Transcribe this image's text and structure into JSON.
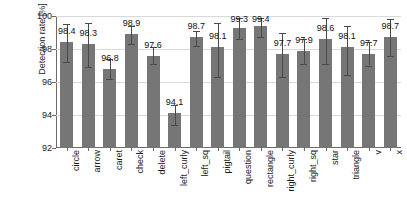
{
  "chart_data": {
    "type": "bar",
    "title": "",
    "xlabel": "",
    "ylabel": "Detection rate [%]",
    "ylim": [
      92,
      100
    ],
    "yticks": [
      92,
      94,
      96,
      98,
      100
    ],
    "grid": true,
    "legend": false,
    "bar_color": "#767676",
    "errorbar_color": "#4a4a4a",
    "categories": [
      "circle",
      "arrow",
      "caret",
      "check",
      "delete",
      "left_curly",
      "left_sq",
      "pigtail",
      "question",
      "rectangle",
      "right_curly",
      "right_sq",
      "star",
      "triangle",
      "v",
      "x"
    ],
    "values": [
      98.4,
      98.3,
      96.8,
      98.9,
      97.6,
      94.1,
      98.7,
      98.1,
      99.3,
      99.4,
      97.7,
      97.9,
      98.6,
      98.1,
      97.7,
      98.7
    ],
    "value_labels": [
      "98.4",
      "98.3",
      "96.8",
      "98.9",
      "97.6",
      "94.1",
      "98.7",
      "98.1",
      "99.3",
      "99.4",
      "97.7",
      "97.9",
      "98.6",
      "98.1",
      "97.7",
      "98.7"
    ],
    "error_low": [
      97.2,
      96.9,
      96.2,
      98.3,
      97.1,
      93.4,
      98.2,
      96.3,
      98.6,
      98.7,
      96.3,
      97.1,
      97.1,
      96.4,
      97.0,
      97.6
    ],
    "error_high": [
      99.5,
      99.6,
      97.4,
      99.4,
      98.1,
      94.6,
      99.1,
      99.6,
      99.9,
      99.9,
      99.0,
      98.6,
      99.9,
      99.4,
      98.4,
      99.8
    ]
  }
}
